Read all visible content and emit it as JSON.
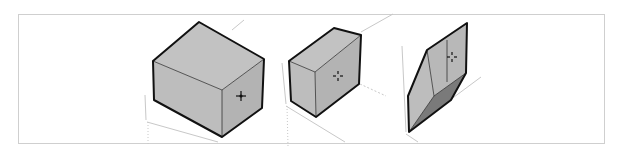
{
  "figure": {
    "colors": {
      "frame_border": "#cfcfcf",
      "face_light": "#c4c4c4",
      "face_mid": "#b4b4b4",
      "face_dark": "#7a7a7a",
      "edge": "#111111",
      "axis_line": "#c8c8c8"
    },
    "panels": [
      {
        "name": "box-1",
        "cursor_icon": "move-cursor-icon"
      },
      {
        "name": "box-2",
        "cursor_icon": "move-cursor-icon"
      },
      {
        "name": "box-3",
        "cursor_icon": "move-cursor-icon"
      }
    ]
  }
}
